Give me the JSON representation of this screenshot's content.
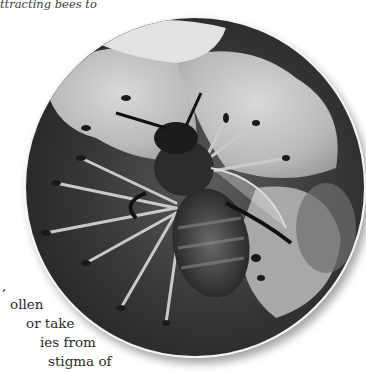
{
  "caption": {
    "text": "ttracting bees to"
  },
  "body_text": {
    "lines": [
      ",",
      "ollen",
      "or take",
      "ies from",
      "stigma of"
    ]
  },
  "photo": {
    "subject": "honeybee on white flower, grayscale",
    "shape": "circle"
  }
}
